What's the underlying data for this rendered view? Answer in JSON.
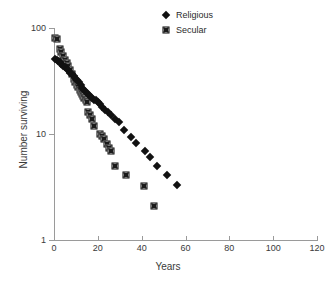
{
  "chart_data": {
    "type": "scatter",
    "title": "",
    "xlabel": "Years",
    "ylabel": "Number surviving",
    "xlim": [
      0,
      120
    ],
    "ylim": [
      1,
      100
    ],
    "yscale": "log",
    "xscale": "linear",
    "grid": false,
    "legend_position": "top-right",
    "xticks": [
      0,
      20,
      40,
      60,
      80,
      100,
      120
    ],
    "xtick_labels": [
      "0",
      "20",
      "40",
      "60",
      "80",
      "100",
      "120"
    ],
    "yticks": [
      1,
      10,
      100
    ],
    "ytick_labels": [
      "1",
      "10",
      "100"
    ],
    "series": [
      {
        "name": "Religious",
        "marker": "filled-diamond",
        "color": "#111111",
        "points": [
          [
            0.5,
            51
          ],
          [
            1.2,
            50
          ],
          [
            1.9,
            49
          ],
          [
            2.6,
            48
          ],
          [
            3.4,
            46
          ],
          [
            4.2,
            44
          ],
          [
            5.0,
            43
          ],
          [
            5.8,
            41
          ],
          [
            6.6,
            40
          ],
          [
            7.4,
            38
          ],
          [
            8.2,
            37
          ],
          [
            9.0,
            35
          ],
          [
            9.8,
            34
          ],
          [
            10.6,
            32
          ],
          [
            11.4,
            31
          ],
          [
            12.2,
            29
          ],
          [
            13.0,
            27
          ],
          [
            13.8,
            26
          ],
          [
            14.6,
            25
          ],
          [
            15.4,
            24
          ],
          [
            16.3,
            23
          ],
          [
            17.2,
            22
          ],
          [
            18.1,
            21
          ],
          [
            19.0,
            21
          ],
          [
            20.0,
            20
          ],
          [
            21.0,
            19
          ],
          [
            22.0,
            18
          ],
          [
            23.2,
            17
          ],
          [
            24.5,
            16
          ],
          [
            26.0,
            15
          ],
          [
            28.0,
            14
          ],
          [
            29.5,
            13
          ],
          [
            32.0,
            11
          ],
          [
            35.0,
            9.3
          ],
          [
            37.5,
            8.2
          ],
          [
            41.5,
            6.9
          ],
          [
            44.0,
            6.1
          ],
          [
            47.0,
            5.0
          ],
          [
            51.5,
            4.1
          ],
          [
            56.0,
            3.3
          ]
        ]
      },
      {
        "name": "Secular",
        "marker": "crosshatch-square",
        "color": "#1a1a1a",
        "points": [
          [
            0.6,
            80
          ],
          [
            1.4,
            79
          ],
          [
            2.6,
            63
          ],
          [
            3.3,
            59
          ],
          [
            4.2,
            55
          ],
          [
            5.0,
            50
          ],
          [
            5.8,
            47
          ],
          [
            6.6,
            44
          ],
          [
            7.4,
            40
          ],
          [
            8.2,
            37
          ],
          [
            8.9,
            33
          ],
          [
            9.6,
            31
          ],
          [
            10.3,
            29
          ],
          [
            11.0,
            28
          ],
          [
            11.7,
            26
          ],
          [
            12.3,
            25
          ],
          [
            12.9,
            24
          ],
          [
            13.4,
            23
          ],
          [
            13.9,
            22
          ],
          [
            14.4,
            21
          ],
          [
            14.9,
            20
          ],
          [
            15.6,
            16
          ],
          [
            16.4,
            15
          ],
          [
            17.3,
            14
          ],
          [
            18.2,
            12
          ],
          [
            21.0,
            10
          ],
          [
            22.0,
            9.5
          ],
          [
            23.0,
            8.9
          ],
          [
            24.0,
            8.0
          ],
          [
            25.0,
            7.4
          ],
          [
            26.0,
            6.9
          ],
          [
            28.0,
            5.0
          ],
          [
            33.0,
            4.1
          ],
          [
            41.0,
            3.2
          ],
          [
            45.5,
            2.1
          ]
        ]
      }
    ]
  },
  "legend": {
    "items": [
      {
        "label": "Religious",
        "marker": "filled-diamond"
      },
      {
        "label": "Secular",
        "marker": "crosshatch-square"
      }
    ]
  },
  "axes": {
    "x_title": "Years",
    "y_title": "Number surviving"
  }
}
